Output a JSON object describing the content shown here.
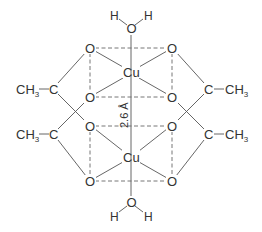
{
  "atoms": {
    "metal": "Cu",
    "oxygen": "O",
    "hydrogen": "H",
    "carbon": "C",
    "methyl_main": "CH",
    "methyl_sub": "3"
  },
  "annotation": {
    "cu_cu_distance": "2.6 Å"
  },
  "colors": {
    "lines": "#555555",
    "text": "#333333",
    "background": "#ffffff"
  }
}
